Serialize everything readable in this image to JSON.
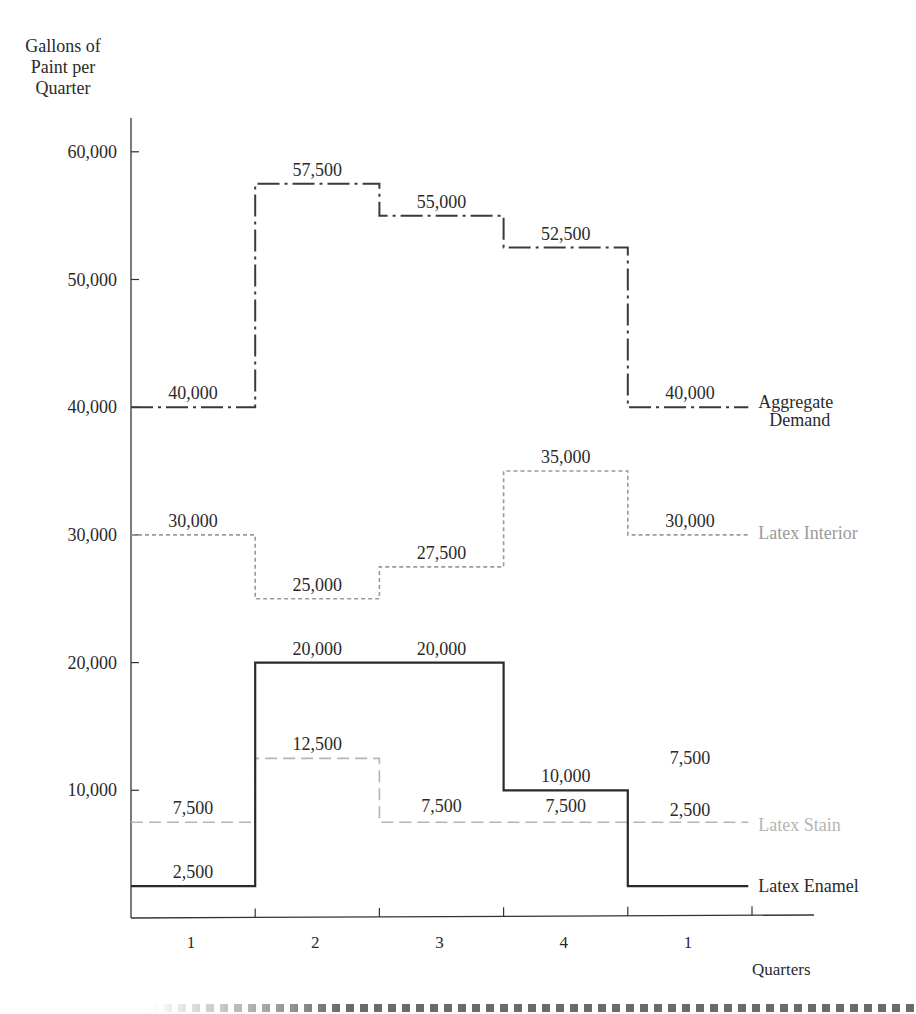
{
  "page": {
    "ylabel_lines": [
      "Gallons of",
      "Paint per",
      "Quarter"
    ],
    "xlabel": "Quarters"
  },
  "chart_data": {
    "type": "line",
    "subtype": "step",
    "title": "",
    "xlabel": "Quarters",
    "ylabel": "Gallons of Paint per Quarter",
    "categories": [
      "1",
      "2",
      "3",
      "4",
      "1"
    ],
    "yticks": [
      10000,
      20000,
      30000,
      40000,
      50000,
      60000
    ],
    "ytick_labels": [
      "10,000",
      "20,000",
      "30,000",
      "40,000",
      "50,000",
      "60,000"
    ],
    "ylim": [
      0,
      62000
    ],
    "grid": false,
    "legend_position": "inline-right",
    "series": [
      {
        "name": "Aggregate Demand",
        "label_lines": [
          "Aggregate",
          "Demand"
        ],
        "values": [
          40000,
          57500,
          55000,
          52500,
          40000
        ],
        "value_labels": [
          "40,000",
          "57,500",
          "55,000",
          "52,500",
          "40,000"
        ],
        "style": "dash-dot",
        "color": "#3a3a3a"
      },
      {
        "name": "Latex Interior",
        "label_lines": [
          "Latex Interior"
        ],
        "values": [
          30000,
          25000,
          27500,
          35000,
          30000
        ],
        "value_labels": [
          "30,000",
          "25,000",
          "27,500",
          "35,000",
          "30,000"
        ],
        "style": "dotted",
        "color": "#9a9a9a"
      },
      {
        "name": "Latex Stain",
        "label_lines": [
          "Latex Stain"
        ],
        "values": [
          7500,
          12500,
          7500,
          7500,
          7500
        ],
        "value_labels": [
          "7,500",
          "12,500",
          "7,500",
          "7,500",
          "7,500"
        ],
        "style": "dashed",
        "color": "#b5b5b5"
      },
      {
        "name": "Latex Enamel",
        "label_lines": [
          "Latex Enamel"
        ],
        "values": [
          2500,
          20000,
          20000,
          10000,
          2500
        ],
        "value_labels": [
          "2,500",
          "20,000",
          "20,000",
          "10,000",
          "2,500"
        ],
        "style": "solid",
        "color": "#2a2a2a"
      }
    ]
  }
}
